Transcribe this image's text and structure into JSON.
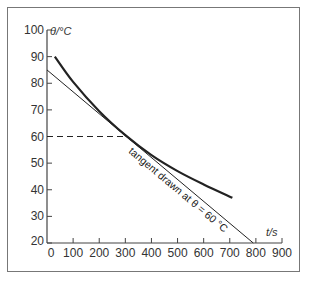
{
  "chart_data": {
    "type": "line",
    "title": "",
    "xlabel": "t/s",
    "ylabel": "θ/°C",
    "xlim": [
      0,
      900
    ],
    "ylim": [
      20,
      100
    ],
    "x_ticks": [
      0,
      100,
      200,
      300,
      400,
      500,
      600,
      700,
      800,
      900
    ],
    "y_ticks": [
      20,
      30,
      40,
      50,
      60,
      70,
      80,
      90,
      100
    ],
    "grid": false,
    "series": [
      {
        "name": "cooling curve",
        "style": "thick solid",
        "x": [
          30,
          100,
          200,
          300,
          400,
          500,
          600,
          710
        ],
        "y": [
          90,
          80.5,
          69.5,
          60.5,
          53,
          47,
          42,
          37
        ]
      },
      {
        "name": "tangent",
        "style": "thin solid",
        "x": [
          0,
          790
        ],
        "y": [
          85,
          20
        ]
      },
      {
        "name": "reference at 60 °C",
        "style": "dashed",
        "x": [
          0,
          300
        ],
        "y": [
          60,
          60
        ]
      }
    ],
    "annotations": [
      {
        "text": "tangent drawn at θ = 60 °C",
        "along": "tangent"
      }
    ]
  },
  "labels": {
    "ylabel": "θ/°C",
    "xlabel": "t/s",
    "annotation": "tangent drawn at θ = 60 °C"
  }
}
